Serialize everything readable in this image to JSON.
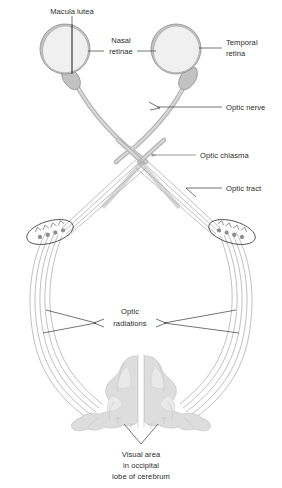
{
  "figure": {
    "background_color": "#ffffff",
    "width": 282,
    "height": 488
  },
  "labels": {
    "macula_lutea": "Macula lutea",
    "nasal_retinae_line1": "Nasal",
    "nasal_retinae_line2": "retinae",
    "temporal_retina_line1": "Temporal",
    "temporal_retina_line2": "retina",
    "optic_nerve": "Optic nerve",
    "optic_chiasma": "Optic chiasma",
    "optic_tract": "Optic tract",
    "optic_radiations_line1": "Optic",
    "optic_radiations_line2": "radiations",
    "visual_area_line1": "Visual area",
    "visual_area_line2": "in occipital",
    "visual_area_line3": "lobe of cerebrum"
  },
  "structures": {
    "left_eye": "left-eyeball",
    "right_eye": "right-eyeball",
    "left_optic_nerve": "left-optic-nerve",
    "right_optic_nerve": "right-optic-nerve",
    "chiasma": "optic-chiasma",
    "left_optic_tract": "left-optic-tract",
    "right_optic_tract": "right-optic-tract",
    "left_lgb": "left-lateral-geniculate-body",
    "right_lgb": "right-lateral-geniculate-body",
    "left_radiations": "left-optic-radiations",
    "right_radiations": "right-optic-radiations",
    "occipital_cortex": "occipital-lobe-cortex"
  },
  "colors": {
    "nerve_band": "#b4b4b4",
    "nerve_core": "#d8d8d8",
    "fiber": "#9d9d9d",
    "eye_outer": "#c2c2c2",
    "eye_inner": "#f0f0f0",
    "cortex": "#dddddd",
    "text": "#2b2b2b",
    "leader": "#3a3a3a",
    "arrow_gray": "#9a9a9a"
  }
}
